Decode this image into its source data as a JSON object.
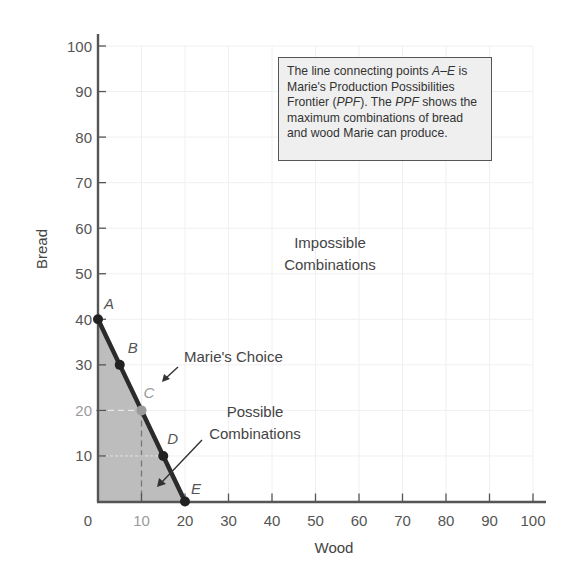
{
  "chart_data": {
    "type": "line",
    "title": "",
    "xlabel": "Wood",
    "ylabel": "Bread",
    "xlim": [
      0,
      100
    ],
    "ylim": [
      0,
      100
    ],
    "grid": true,
    "x_ticks": [
      0,
      10,
      20,
      30,
      40,
      50,
      60,
      70,
      80,
      90,
      100
    ],
    "y_ticks": [
      10,
      20,
      30,
      40,
      50,
      60,
      70,
      80,
      90,
      100
    ],
    "series": [
      {
        "name": "Production Possibilities Frontier (PPF)",
        "points": [
          {
            "label": "A",
            "x": 0,
            "y": 40
          },
          {
            "label": "B",
            "x": 5,
            "y": 30
          },
          {
            "label": "C",
            "x": 10,
            "y": 20
          },
          {
            "label": "D",
            "x": 15,
            "y": 10
          },
          {
            "label": "E",
            "x": 20,
            "y": 0
          }
        ]
      }
    ],
    "shaded_region": "area under PPF (Possible Combinations)",
    "highlighted_point": {
      "label": "C",
      "x": 10,
      "y": 20,
      "note": "Marie's Choice"
    },
    "annotations": [
      {
        "text": "Impossible Combinations",
        "x": 50,
        "y": 52
      },
      {
        "text": "Marie's Choice",
        "x": 18,
        "y": 31,
        "arrow_to": "C"
      },
      {
        "text": "Possible Combinations",
        "x": 30,
        "y": 16,
        "arrow_to": [
          12,
          4
        ]
      }
    ],
    "info_box": "The line connecting points A–E is Marie's Production Possibilities Frontier (PPF). The PPF shows the maximum combinations of bread and wood Marie can produce."
  },
  "axes": {
    "x_title": "Wood",
    "y_title": "Bread",
    "x_tick_labels": [
      "0",
      "10",
      "20",
      "30",
      "40",
      "50",
      "60",
      "70",
      "80",
      "90",
      "100"
    ],
    "y_tick_labels": [
      "10",
      "20",
      "30",
      "40",
      "50",
      "60",
      "70",
      "80",
      "90",
      "100"
    ]
  },
  "points": {
    "A": "A",
    "B": "B",
    "C": "C",
    "D": "D",
    "E": "E"
  },
  "annotations": {
    "impossible_line1": "Impossible",
    "impossible_line2": "Combinations",
    "choice": "Marie's Choice",
    "possible_line1": "Possible",
    "possible_line2": "Combinations"
  },
  "info_box": {
    "part1": "The line connecting points ",
    "part2_italic": "A–E",
    "part3": " is Marie's Production Possibilities Frontier (",
    "part4_italic": "PPF",
    "part5": "). The ",
    "part6_italic": "PPF",
    "part7": " shows the maximum combinations of bread and wood Marie can produce."
  },
  "colors": {
    "axis": "#555555",
    "ppf_line": "#2b2b2b",
    "shade": "#b9b9b9",
    "grid": "#efefef",
    "highlight": "#9a9a9a",
    "box_bg": "#efefef"
  }
}
